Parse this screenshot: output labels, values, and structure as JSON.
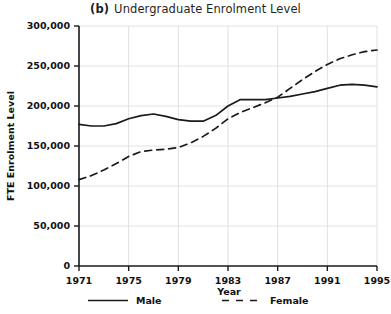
{
  "chart_data": {
    "type": "line",
    "title": "Undergraduate Enrolment Level",
    "panel_label": "(b)",
    "xlabel": "Year",
    "ylabel": "FTE Enrolment Level",
    "xlim": [
      1971,
      1995
    ],
    "ylim": [
      0,
      300000
    ],
    "xticks": [
      1971,
      1975,
      1979,
      1983,
      1987,
      1991,
      1995
    ],
    "xtick_labels": [
      "1971",
      "1975",
      "1979",
      "1983",
      "1987",
      "1991",
      "1995"
    ],
    "yticks": [
      0,
      50000,
      100000,
      150000,
      200000,
      250000,
      300000
    ],
    "ytick_labels": [
      "0",
      "50,000",
      "100,000",
      "150,000",
      "200,000",
      "250,000",
      "300,000"
    ],
    "grid": true,
    "grid_axis": "both",
    "legend_position": "bottom",
    "x": [
      1971,
      1972,
      1973,
      1974,
      1975,
      1976,
      1977,
      1978,
      1979,
      1980,
      1981,
      1982,
      1983,
      1984,
      1985,
      1986,
      1987,
      1988,
      1989,
      1990,
      1991,
      1992,
      1993,
      1994,
      1995
    ],
    "series": [
      {
        "name": "Male",
        "style": "solid",
        "color": "#1a1a1a",
        "values": [
          177000,
          175000,
          175000,
          178000,
          184000,
          188000,
          190000,
          187000,
          183000,
          181000,
          181000,
          188000,
          200000,
          208000,
          208000,
          208000,
          210000,
          212000,
          215000,
          218000,
          222000,
          226000,
          227000,
          226000,
          224000
        ]
      },
      {
        "name": "Female",
        "style": "dashed",
        "color": "#1a1a1a",
        "values": [
          108000,
          113000,
          120000,
          128000,
          137000,
          143000,
          145000,
          146000,
          148000,
          154000,
          162000,
          172000,
          184000,
          192000,
          198000,
          204000,
          211000,
          222000,
          233000,
          243000,
          252000,
          259000,
          264000,
          268000,
          270000
        ]
      }
    ]
  },
  "legend": {
    "items": [
      {
        "label": "Male",
        "style": "solid"
      },
      {
        "label": "Female",
        "style": "dashed"
      }
    ]
  }
}
